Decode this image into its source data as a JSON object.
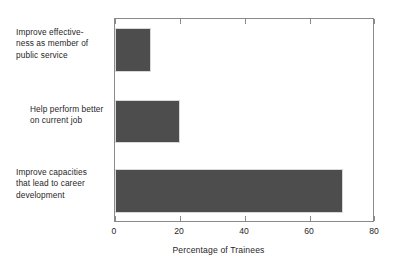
{
  "chart_data": {
    "type": "bar",
    "orientation": "horizontal",
    "title": "",
    "subtitle": "",
    "xlabel": "Percentage of Trainees",
    "ylabel": "",
    "categories": [
      "Improve effective-\nness as member of\npublic service",
      "Help perform better\non current job",
      "Improve capacities\nthat lead to career\ndevelopment"
    ],
    "values": [
      11,
      20,
      70
    ],
    "xlim": [
      0,
      80
    ],
    "xticks": [
      0,
      20,
      40,
      60,
      80
    ],
    "xtick_labels": [
      "0",
      "20",
      "40",
      "60",
      "80"
    ],
    "grid": false,
    "legend": null,
    "bar_color": "#4d4d4d",
    "frame_color": "#8a8a8a",
    "background": "#ffffff"
  }
}
